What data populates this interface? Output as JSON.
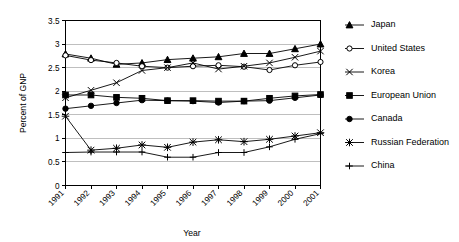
{
  "chart_data": {
    "type": "line",
    "title": "",
    "xlabel": "Year",
    "ylabel": "Percent of GNP",
    "categories": [
      "1991",
      "1992",
      "1993",
      "1994",
      "1995",
      "1996",
      "1997",
      "1998",
      "1999",
      "2000",
      "2001"
    ],
    "x": [
      1991,
      1992,
      1993,
      1994,
      1995,
      1996,
      1997,
      1998,
      1999,
      2000,
      2001
    ],
    "ylim": [
      0,
      3.5
    ],
    "yticks": [
      "0",
      "0.5",
      "1",
      "1.5",
      "2",
      "2.5",
      "3",
      "3.5"
    ],
    "ytick_values": [
      0,
      0.5,
      1,
      1.5,
      2,
      2.5,
      3,
      3.5
    ],
    "grid": "horizontal",
    "legend_position": "right",
    "series": [
      {
        "name": "Japan",
        "marker": "filled-triangle",
        "values": [
          2.79,
          2.7,
          2.57,
          2.6,
          2.67,
          2.7,
          2.73,
          2.8,
          2.8,
          2.9,
          3.0
        ]
      },
      {
        "name": "United States",
        "marker": "open-circle",
        "values": [
          2.76,
          2.66,
          2.6,
          2.53,
          2.5,
          2.53,
          2.55,
          2.52,
          2.45,
          2.55,
          2.62
        ]
      },
      {
        "name": "Korea",
        "marker": "cross-x",
        "values": [
          1.86,
          2.02,
          2.18,
          2.44,
          2.5,
          2.6,
          2.47,
          2.53,
          2.6,
          2.72,
          2.85
        ]
      },
      {
        "name": "European Union",
        "marker": "filled-square",
        "values": [
          1.92,
          1.92,
          1.87,
          1.85,
          1.8,
          1.8,
          1.79,
          1.79,
          1.85,
          1.9,
          1.93
        ]
      },
      {
        "name": "Canada",
        "marker": "filled-circle",
        "values": [
          1.63,
          1.69,
          1.75,
          1.81,
          1.8,
          1.79,
          1.76,
          1.79,
          1.8,
          1.86,
          1.92
        ]
      },
      {
        "name": "Russian Federation",
        "marker": "asterisk",
        "values": [
          1.47,
          0.75,
          0.79,
          0.86,
          0.81,
          0.92,
          0.97,
          0.93,
          0.98,
          1.05,
          1.12
        ]
      },
      {
        "name": "China",
        "marker": "plus",
        "values": [
          0.7,
          0.71,
          0.71,
          0.71,
          0.6,
          0.6,
          0.7,
          0.7,
          0.82,
          0.98,
          1.1
        ]
      }
    ]
  },
  "colors": {
    "ink": "#000000",
    "grid": "#bfbfbf",
    "background": "#ffffff"
  }
}
